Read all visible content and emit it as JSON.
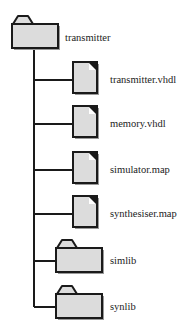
{
  "diagram": {
    "type": "directory-tree",
    "colors": {
      "stroke": "#1a1a1a",
      "fill": "#dcdcdc",
      "shadow": "#9a9a9a",
      "background": "#ffffff"
    },
    "root": {
      "name": "transmitter",
      "kind": "folder"
    },
    "children": [
      {
        "name": "transmitter.vhdl",
        "kind": "file"
      },
      {
        "name": "memory.vhdl",
        "kind": "file"
      },
      {
        "name": "simulator.map",
        "kind": "file"
      },
      {
        "name": "synthesiser.map",
        "kind": "file"
      },
      {
        "name": "simlib",
        "kind": "folder"
      },
      {
        "name": "synlib",
        "kind": "folder"
      }
    ]
  }
}
